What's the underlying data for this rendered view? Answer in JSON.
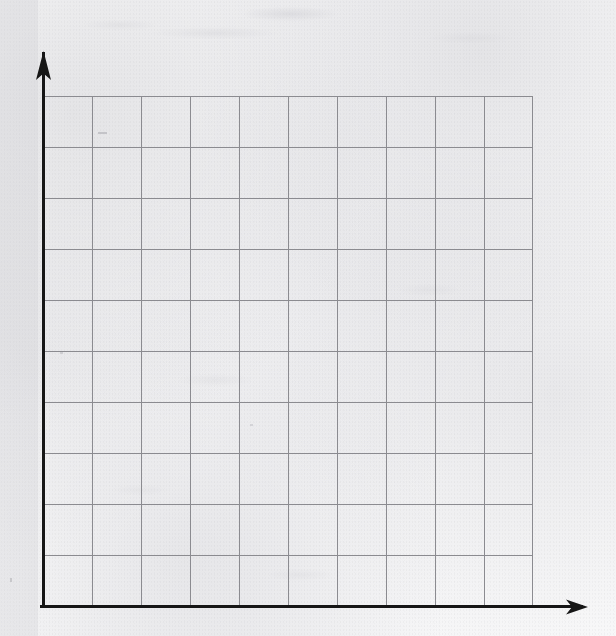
{
  "figure": {
    "kind": "blank-coordinate-grid",
    "title": "",
    "medium": "scanned graph paper",
    "paper_color": "#f4f4f5",
    "ink_color": "#161616",
    "gridline_color": "#8b8b90"
  },
  "chart_data": {
    "type": "scatter",
    "title": "",
    "subtitle": "",
    "xlabel": "",
    "ylabel": "",
    "annotations": [],
    "legend": [],
    "legend_position": "none",
    "grid": true,
    "grid_columns": 10,
    "grid_rows": 10,
    "xlim": [
      0,
      10
    ],
    "ylim": [
      0,
      10
    ],
    "xticks": [],
    "yticks": [],
    "xticklabels": [],
    "yticklabels": [],
    "series": [],
    "x": [],
    "values": []
  },
  "axes": {
    "y_axis": {
      "name": "vertical axis",
      "label": "",
      "arrow": "up",
      "thickness_px": 3,
      "origin_px": {
        "x": 43,
        "y": 606
      },
      "tip_px": {
        "x": 43,
        "y": 52
      }
    },
    "x_axis": {
      "name": "horizontal axis",
      "label": "",
      "arrow": "right",
      "thickness_px": 3,
      "origin_px": {
        "x": 43,
        "y": 606
      },
      "tip_px": {
        "x": 586,
        "y": 606
      }
    }
  },
  "grid": {
    "left_px": 43,
    "top_px": 96,
    "right_px": 533,
    "bottom_px": 606,
    "columns": 10,
    "rows": 10,
    "cell_width_px": 49,
    "cell_height_px": 51,
    "line_color": "#8b8b90",
    "line_width_px": 1
  },
  "canvas": {
    "width": 616,
    "height": 636
  }
}
